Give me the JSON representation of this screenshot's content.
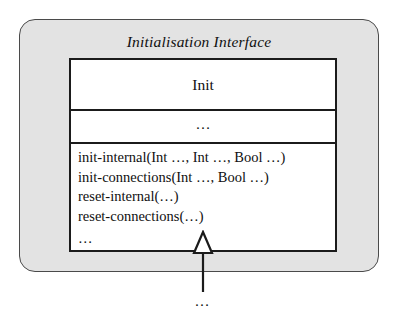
{
  "diagram": {
    "package": {
      "title": "Initialisation Interface"
    },
    "class_box": {
      "name": "Init",
      "attributes_placeholder": "…",
      "operations": [
        "init-internal(Int …, Int …, Bool …)",
        "init-connections(Int …, Bool …)",
        "reset-internal(…)",
        "reset-connections(…)"
      ],
      "operations_placeholder": "…"
    },
    "connector": {
      "type": "generalization",
      "arrowhead": "hollow-triangle",
      "target_placeholder": "…"
    },
    "colors": {
      "package_fill": "#e3e3e3",
      "package_border": "#4a4a4a",
      "class_fill": "#ffffff",
      "class_border": "#1b1b1b",
      "text": "#101010"
    }
  }
}
